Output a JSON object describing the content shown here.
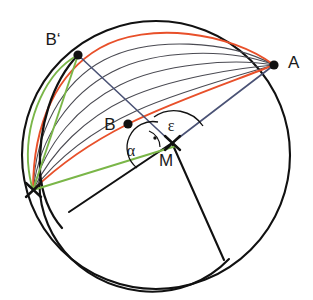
{
  "figure": {
    "title": "",
    "background": "#ffffff",
    "width": 313,
    "height": 300
  },
  "colors": {
    "outline": "#111111",
    "arc_family": "#4a4a52",
    "highlight_arc": "#e8502a",
    "chord_blue": "#4a5275",
    "chord_green": "#7ab648",
    "point_fill": "#111111",
    "label_text": "#1a1a1a"
  },
  "labels": {
    "b_prime": "B‘",
    "a": "A",
    "b": "B",
    "m": "M",
    "alpha": "α",
    "epsilon": "ε"
  },
  "points": {
    "b_prime": {
      "name": "B'",
      "x": 78,
      "y": 55
    },
    "a": {
      "name": "A",
      "x": 274,
      "y": 65
    },
    "b": {
      "name": "B",
      "x": 128,
      "y": 124
    },
    "m": {
      "name": "M",
      "x": 172,
      "y": 143
    },
    "left_mark": {
      "name": "X",
      "x": 33,
      "y": 190
    }
  },
  "label_positions": {
    "b_prime": {
      "x": 53,
      "y": 45
    },
    "a": {
      "x": 288,
      "y": 68
    },
    "b": {
      "x": 110,
      "y": 130
    },
    "m": {
      "x": 166,
      "y": 166
    },
    "alpha": {
      "x": 131,
      "y": 156
    },
    "epsilon": {
      "x": 168,
      "y": 132
    }
  },
  "main_circle": {
    "cx": 156,
    "cy": 155,
    "r": 134
  },
  "inner_arc": {
    "description": "secondary arc inside lower-left of main circle"
  },
  "angles": {
    "alpha": {
      "label": "α",
      "vertex": "M",
      "between": [
        "M-left_mark",
        "M-B'"
      ]
    },
    "epsilon": {
      "label": "ε",
      "vertex": "M",
      "between": [
        "M-B'",
        "M-A"
      ]
    },
    "right_angle": {
      "label": "",
      "vertex": "M",
      "marker": "square-dot"
    }
  },
  "arc_family": {
    "count": 6,
    "description": "family of arcs from lower-left marker fanning to point A",
    "highlighted_indices": [
      0,
      5
    ]
  },
  "radial_lines": [
    {
      "name": "radius-lower-left",
      "from": "M",
      "to_x": 69,
      "to_y": 212
    },
    {
      "name": "radius-lower-right",
      "from": "M",
      "to_x": 224,
      "to_y": 260
    }
  ]
}
